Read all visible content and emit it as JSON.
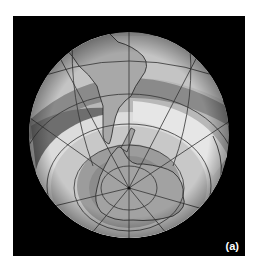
{
  "figure": {
    "panel_label": "(a)",
    "background_color": "#000000",
    "projection": "orthographic",
    "view_center": "South Atlantic / Antarctic",
    "features": [
      "South America",
      "Antarctic Peninsula",
      "Antarctica",
      "Africa (partial)",
      "South Pole"
    ],
    "graticule": {
      "meridians": true,
      "parallels": true,
      "color": "#333333"
    },
    "shading_levels": [
      "#5a5a5a",
      "#7a7a7a",
      "#9a9a9a",
      "#b4b4b4",
      "#cfcfcf",
      "#e4e4e4"
    ]
  }
}
